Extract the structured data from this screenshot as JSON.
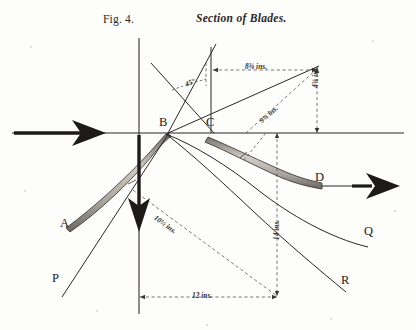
{
  "figure": {
    "number_label": "Fig. 4.",
    "title": "Section of Blades.",
    "domain_type": "engineering-drawing"
  },
  "points": [
    {
      "id": "A",
      "label": "A",
      "x": 66,
      "y": 224
    },
    {
      "id": "B",
      "label": "B",
      "x": 165,
      "y": 126
    },
    {
      "id": "C",
      "label": "C",
      "x": 212,
      "y": 126
    },
    {
      "id": "D",
      "label": "D",
      "x": 318,
      "y": 178
    },
    {
      "id": "P",
      "label": "P",
      "x": 57,
      "y": 279
    },
    {
      "id": "Q",
      "label": "Q",
      "x": 368,
      "y": 232
    },
    {
      "id": "R",
      "label": "R",
      "x": 345,
      "y": 281
    }
  ],
  "dimensions": [
    {
      "id": "top-horizontal",
      "text": "8⅜ ins.",
      "value": 8.375,
      "unit": "ins",
      "orientation": "horizontal"
    },
    {
      "id": "right-vertical",
      "text": "4⅜ ins.",
      "value": 4.375,
      "unit": "ins",
      "orientation": "vertical"
    },
    {
      "id": "upper-diagonal",
      "text": "9⅜ ins.",
      "value": 9.375,
      "unit": "ins",
      "orientation": "diagonal"
    },
    {
      "id": "lower-diagonal",
      "text": "10½ ins.",
      "value": 10.5,
      "unit": "ins",
      "orientation": "diagonal"
    },
    {
      "id": "bottom-horizontal",
      "text": "12 ins.",
      "value": 12,
      "unit": "ins",
      "orientation": "horizontal"
    },
    {
      "id": "mid-vertical",
      "text": "14 ins.",
      "value": 14,
      "unit": "ins",
      "orientation": "vertical"
    }
  ],
  "angles": [
    {
      "id": "blade-angle",
      "text": "45°",
      "value": 45,
      "unit": "deg"
    }
  ],
  "arrows": [
    {
      "id": "inlet-arrow",
      "direction": "right",
      "description": "incoming flow"
    },
    {
      "id": "outlet-arrow",
      "direction": "right",
      "description": "outgoing flow"
    },
    {
      "id": "downward-arrow",
      "direction": "down",
      "description": "vertical flow"
    }
  ],
  "colors": {
    "ink": "#2a2724",
    "ink_dark": "#1d1b19",
    "blade_fill": "#b3aea6",
    "blade_edge": "#3a3733",
    "dashed": "#5a5650",
    "paper": "#fdfdfc"
  }
}
